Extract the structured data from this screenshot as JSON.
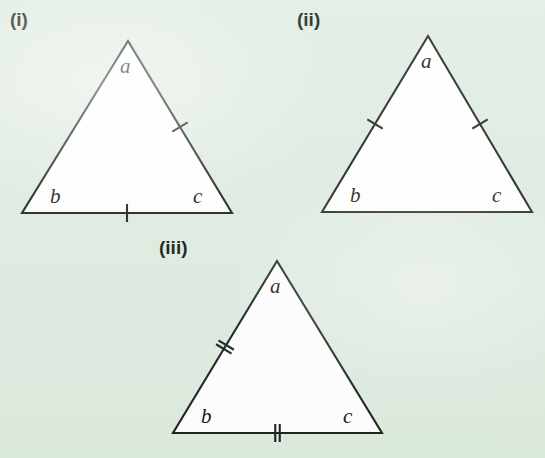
{
  "background_color": "#dfece0",
  "ink_color": "#1d2420",
  "fill_color": "#ffffff",
  "figure": {
    "triangles": [
      {
        "id": "triangle-i",
        "roman_label": "(i)",
        "roman_label_x": 10,
        "roman_label_y": 26,
        "apex": {
          "x": 128,
          "y": 41
        },
        "left": {
          "x": 22,
          "y": 213
        },
        "right": {
          "x": 232,
          "y": 213
        },
        "vertex_labels": {
          "apex": "a",
          "bottom_left": "b",
          "bottom_right": "c"
        },
        "label_positions": {
          "apex": {
            "x": 120,
            "y": 73
          },
          "bottom_left": {
            "x": 50,
            "y": 203
          },
          "bottom_right": {
            "x": 193,
            "y": 203
          }
        },
        "marks": [
          {
            "side": "right",
            "count": 1
          },
          {
            "side": "bottom",
            "count": 1
          }
        ]
      },
      {
        "id": "triangle-ii",
        "roman_label": "(ii)",
        "roman_label_x": 297,
        "roman_label_y": 26,
        "apex": {
          "x": 428,
          "y": 36
        },
        "left": {
          "x": 322,
          "y": 212
        },
        "right": {
          "x": 532,
          "y": 212
        },
        "vertex_labels": {
          "apex": "a",
          "bottom_left": "b",
          "bottom_right": "c"
        },
        "label_positions": {
          "apex": {
            "x": 421,
            "y": 68
          },
          "bottom_left": {
            "x": 350,
            "y": 202
          },
          "bottom_right": {
            "x": 492,
            "y": 202
          }
        },
        "marks": [
          {
            "side": "left",
            "count": 1
          },
          {
            "side": "right",
            "count": 1
          }
        ]
      },
      {
        "id": "triangle-iii",
        "roman_label": "(iii)",
        "roman_label_x": 159,
        "roman_label_y": 254,
        "apex": {
          "x": 277,
          "y": 261
        },
        "left": {
          "x": 173,
          "y": 433
        },
        "right": {
          "x": 382,
          "y": 433
        },
        "vertex_labels": {
          "apex": "a",
          "bottom_left": "b",
          "bottom_right": "c"
        },
        "label_positions": {
          "apex": {
            "x": 270,
            "y": 293
          },
          "bottom_left": {
            "x": 201,
            "y": 423
          },
          "bottom_right": {
            "x": 343,
            "y": 423
          }
        },
        "marks": [
          {
            "side": "left",
            "count": 2
          },
          {
            "side": "bottom",
            "count": 2
          }
        ]
      }
    ]
  }
}
